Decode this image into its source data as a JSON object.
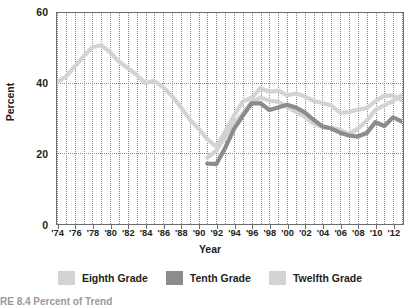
{
  "chart_data": {
    "type": "line",
    "title": "",
    "xlabel": "Year",
    "ylabel": "Percent",
    "ylim": [
      0,
      60
    ],
    "yticks": [
      0,
      20,
      40,
      60
    ],
    "xlim": [
      1974,
      2013
    ],
    "grid": "dotted vertical every year; dotted horizontal at 20 and 40",
    "legend_position": "bottom-center",
    "xtick_labels": [
      "'74",
      "'76",
      "'78",
      "'80",
      "'82",
      "'84",
      "'86",
      "'88",
      "'90",
      "'92",
      "'94",
      "'96",
      "'98",
      "'00",
      "'02",
      "'04",
      "'06",
      "'08",
      "'10",
      "'12"
    ],
    "xtick_years": [
      1974,
      1976,
      1978,
      1980,
      1982,
      1984,
      1986,
      1988,
      1990,
      1992,
      1994,
      1996,
      1998,
      2000,
      2002,
      2004,
      2006,
      2008,
      2010,
      2012
    ],
    "series": [
      {
        "name": "Eighth Grade",
        "color": "#d3d3d3",
        "x": [
          1991,
          1992,
          1993,
          1994,
          1995,
          1996,
          1997,
          1998,
          1999,
          2000,
          2001,
          2002,
          2003,
          2004,
          2005,
          2006,
          2007,
          2008,
          2009,
          2010,
          2011,
          2012,
          2013
        ],
        "values": [
          18.7,
          20.6,
          24.7,
          28.5,
          31.2,
          34.6,
          35.8,
          35.0,
          34.6,
          33.2,
          31.8,
          30.3,
          28.4,
          27.4,
          27.1,
          26.6,
          25.4,
          26.9,
          29.2,
          32.3,
          33.6,
          34.9,
          36.6
        ]
      },
      {
        "name": "Tenth Grade",
        "color": "#8c8c8c",
        "x": [
          1991,
          1992,
          1993,
          1994,
          1995,
          1996,
          1997,
          1998,
          1999,
          2000,
          2001,
          2002,
          2003,
          2004,
          2005,
          2006,
          2007,
          2008,
          2009,
          2010,
          2011,
          2012,
          2013
        ],
        "values": [
          17.0,
          16.8,
          21.4,
          26.8,
          30.6,
          34.2,
          34.2,
          32.3,
          33.0,
          33.8,
          33.0,
          31.6,
          29.5,
          27.6,
          27.0,
          25.8,
          25.0,
          24.7,
          25.7,
          28.8,
          27.7,
          30.2,
          29.0
        ]
      },
      {
        "name": "Twelfth Grade",
        "color": "#d3d3d3",
        "x": [
          1974,
          1975,
          1976,
          1977,
          1978,
          1979,
          1980,
          1981,
          1982,
          1983,
          1984,
          1985,
          1986,
          1987,
          1988,
          1989,
          1990,
          1991,
          1992,
          1993,
          1994,
          1995,
          1996,
          1997,
          1998,
          1999,
          2000,
          2001,
          2002,
          2003,
          2004,
          2005,
          2006,
          2007,
          2008,
          2009,
          2010,
          2011,
          2012,
          2013
        ],
        "values": [
          40.2,
          41.8,
          44.7,
          47.6,
          50.2,
          50.8,
          48.8,
          46.1,
          44.3,
          42.3,
          40.0,
          40.6,
          38.8,
          36.3,
          33.1,
          29.6,
          27.0,
          23.9,
          21.9,
          26.0,
          30.7,
          34.7,
          35.8,
          38.5,
          37.5,
          37.8,
          36.5,
          37.0,
          36.2,
          34.9,
          34.3,
          33.6,
          31.5,
          31.7,
          32.4,
          32.8,
          34.8,
          36.4,
          36.4,
          35.1
        ]
      }
    ]
  },
  "axis": {
    "y_title": "Percent",
    "x_title": "Year",
    "y_tick_labels": [
      "60",
      "40",
      "20",
      "0"
    ]
  },
  "legend": {
    "items": [
      {
        "label": "Eighth Grade",
        "color": "#d3d3d3"
      },
      {
        "label": "Tenth Grade",
        "color": "#8c8c8c"
      },
      {
        "label": "Twelfth Grade",
        "color": "#d3d3d3"
      }
    ]
  },
  "caption": {
    "text": "RE 8.4  Percent of Trend"
  }
}
